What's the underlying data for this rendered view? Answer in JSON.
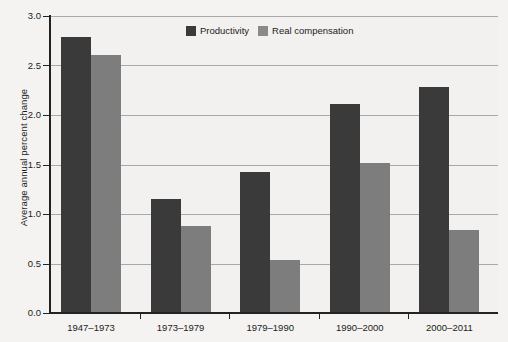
{
  "chart_data": {
    "type": "bar",
    "title": "",
    "xlabel": "",
    "ylabel": "Average annual percent change",
    "ylim": [
      0.0,
      3.0
    ],
    "ytick_labels": [
      "0.0",
      "0.5",
      "1.0",
      "1.5",
      "2.0",
      "2.5",
      "3.0"
    ],
    "ytick_values": [
      0.0,
      0.5,
      1.0,
      1.5,
      2.0,
      2.5,
      3.0
    ],
    "grid": true,
    "legend_position": "inside-top-center",
    "categories": [
      "1947–1973",
      "1973–1979",
      "1979–1990",
      "1990–2000",
      "2000–2011"
    ],
    "series": [
      {
        "name": "Productivity",
        "color": "#3a3a3a",
        "values": [
          2.79,
          1.15,
          1.42,
          2.11,
          2.28
        ]
      },
      {
        "name": "Real compensation",
        "color": "#7d7d7d",
        "values": [
          2.61,
          0.88,
          0.54,
          1.52,
          0.84
        ]
      }
    ]
  },
  "colors": {
    "productivity": "#3a3a3a",
    "real_compensation": "#7d7d7d",
    "gridline": "#a9a9a9",
    "axis": "#222222",
    "plot_background": "#f2f1ef",
    "page_background": "#f4f3f1"
  }
}
